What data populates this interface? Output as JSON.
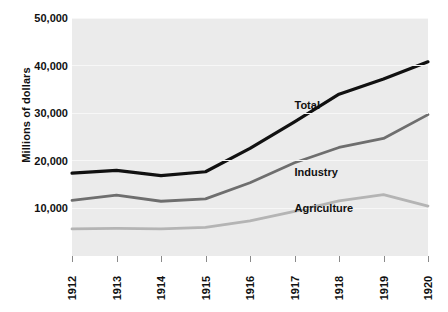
{
  "chart_data": {
    "type": "line",
    "title": "",
    "subtitle": "",
    "xlabel": "",
    "ylabel": "Millions of dollars",
    "categories": [
      "1912",
      "1913",
      "1914",
      "1915",
      "1916",
      "1917",
      "1918",
      "1919",
      "1920"
    ],
    "x": [
      1912,
      1913,
      1914,
      1915,
      1916,
      1917,
      1918,
      1919,
      1920
    ],
    "xlim": [
      1912,
      1920
    ],
    "ylim": [
      0,
      50000
    ],
    "y_ticks": [
      10000,
      20000,
      30000,
      40000,
      50000
    ],
    "y_tick_labels": [
      "10,000",
      "20,000",
      "30,000",
      "40,000",
      "50,000"
    ],
    "grid": true,
    "legend_position": "inline-annotations",
    "series": [
      {
        "name": "Total",
        "color": "#111111",
        "values": [
          17400,
          18000,
          16900,
          17700,
          22600,
          28200,
          34000,
          37200,
          40800
        ]
      },
      {
        "name": "Industry",
        "color": "#6e6e6e",
        "values": [
          11700,
          12800,
          11500,
          12000,
          15400,
          19600,
          22800,
          24700,
          29700
        ]
      },
      {
        "name": "Agriculture",
        "color": "#b4b4b4",
        "values": [
          5700,
          5800,
          5700,
          6000,
          7400,
          9400,
          11600,
          12900,
          10500
        ]
      }
    ],
    "annotations": [
      {
        "text": "Total",
        "x": 1917,
        "y": 31800
      },
      {
        "text": "Industry",
        "x": 1917,
        "y": 17600
      },
      {
        "text": "Agriculture",
        "x": 1917,
        "y": 10000
      }
    ]
  },
  "axes": {
    "y_title": "Millions of dollars"
  },
  "colors": {
    "plot_background": "#ebebeb",
    "page_background": "#ffffff",
    "gridline": "#f7f7f7",
    "tick": "#8a8a8a",
    "text": "#111111",
    "total": "#111111",
    "industry": "#6e6e6e",
    "agriculture": "#b4b4b4"
  }
}
